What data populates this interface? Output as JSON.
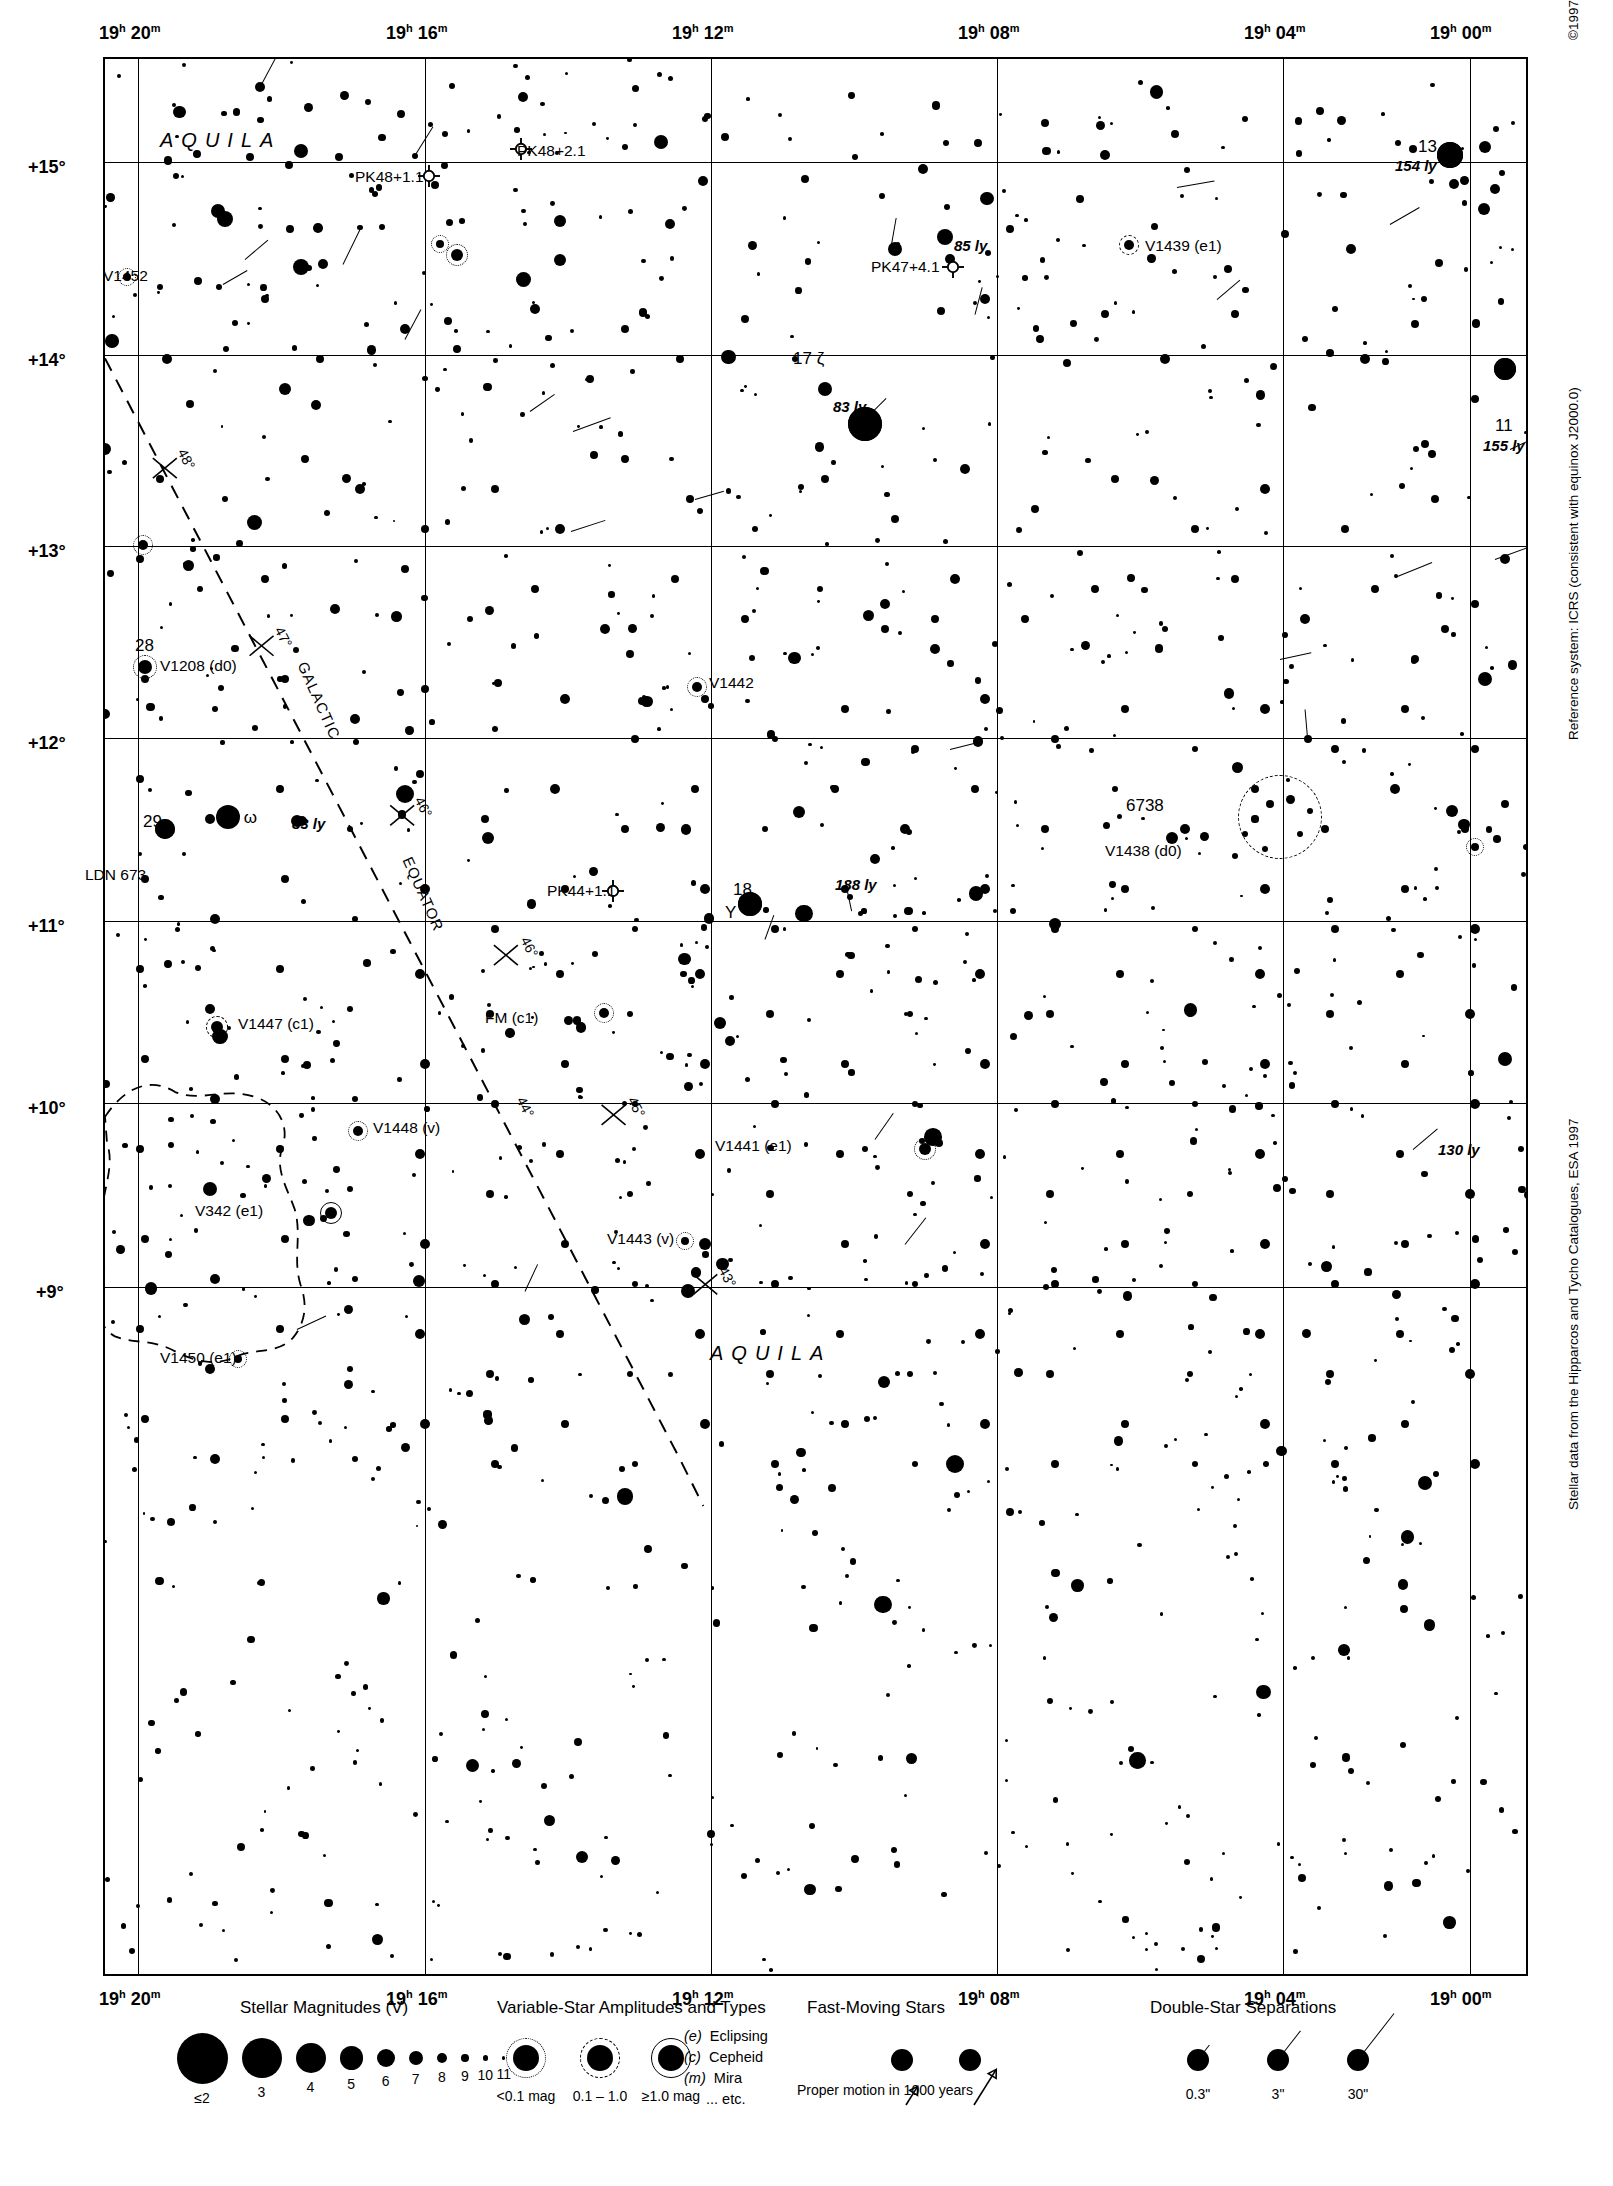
{
  "page": {
    "number": "1245",
    "next_page": "1269",
    "copyright": "©1997 Sky Publishing Corporation",
    "reference_note": "Reference system: ICRS (consistent with equinox J2000.0)",
    "data_note": "Stellar data from the Hipparcos and Tycho Catalogues, ESA 1997"
  },
  "axes": {
    "ra_ticks_top": [
      "19h 20m",
      "19h 16m",
      "19h 12m",
      "19h 08m",
      "19h 04m",
      "19h 00m"
    ],
    "ra_ticks_bottom": [
      "19h 20m",
      "19h 16m",
      "19h 12m",
      "19h 08m",
      "19h 04m",
      "19h 00m"
    ],
    "ra_hours": [
      "19",
      "19",
      "19",
      "19",
      "19",
      "19"
    ],
    "ra_minutes": [
      "20",
      "16",
      "12",
      "08",
      "04",
      "00"
    ],
    "dec_ticks": [
      "+15°",
      "+14°",
      "+13°",
      "+12°",
      "+11°",
      "+10°",
      "+9°"
    ],
    "ra_range": [
      "19h 22m",
      "18h 58m"
    ],
    "dec_range": [
      "+8.4°",
      "+15.8°"
    ]
  },
  "constellation_labels": [
    {
      "name": "AQUILA",
      "x": 155,
      "y": 118
    },
    {
      "name": "AQUILA",
      "x": 705,
      "y": 1345
    }
  ],
  "galactic_equator": {
    "label_word": "GALACTIC",
    "label_word2": "EQUATOR",
    "tick_labels": [
      "48°",
      "47°",
      "46°",
      "45°",
      "44°",
      "43°"
    ]
  },
  "objects": [
    {
      "id": "V1452",
      "label": "V1452",
      "type": "variable",
      "amp": "dot"
    },
    {
      "id": "PK48+1.1",
      "label": "PK48+1.1",
      "type": "planetary-nebula"
    },
    {
      "id": "PK48+2.1",
      "label": "PK48+2.1",
      "type": "planetary-nebula"
    },
    {
      "id": "PK47+4.1",
      "label": "PK47+4.1",
      "type": "planetary-nebula"
    },
    {
      "id": "PK44+1.1",
      "label": "PK44+1.1",
      "type": "planetary-nebula"
    },
    {
      "id": "13eps",
      "label": "13 ε",
      "distance": "154 ly",
      "type": "named-star"
    },
    {
      "id": "17zeta",
      "label": "17 ζ",
      "distance": "83 ly",
      "type": "named-star"
    },
    {
      "id": "11",
      "label": "11",
      "distance": "155 ly",
      "type": "named-star"
    },
    {
      "id": "hip85ly",
      "label": "",
      "distance": "85 ly",
      "type": "nearby-star"
    },
    {
      "id": "hip188ly",
      "label": "",
      "distance": "188 ly",
      "type": "nearby-star"
    },
    {
      "id": "hip130ly",
      "label": "",
      "distance": "130 ly",
      "type": "nearby-star"
    },
    {
      "id": "hip83ly",
      "label": "",
      "distance": "83 ly",
      "type": "nearby-star"
    },
    {
      "id": "V1439",
      "label": "V1439 (e1)",
      "type": "variable",
      "amp": "dash"
    },
    {
      "id": "V1438",
      "label": "V1438 (d0)",
      "type": "variable",
      "amp": "dot"
    },
    {
      "id": "V1442",
      "label": "V1442",
      "type": "variable",
      "amp": "dot"
    },
    {
      "id": "V1441",
      "label": "V1441 (e1)",
      "type": "variable",
      "amp": "dot"
    },
    {
      "id": "V1443",
      "label": "V1443 (v)",
      "type": "variable",
      "amp": "dot"
    },
    {
      "id": "V1447",
      "label": "V1447 (c1)",
      "type": "variable",
      "amp": "dash"
    },
    {
      "id": "V1448",
      "label": "V1448 (v)",
      "type": "variable",
      "amp": "dot"
    },
    {
      "id": "V1450",
      "label": "V1450 (e1)",
      "type": "variable",
      "amp": "dot"
    },
    {
      "id": "V1208",
      "label": "V1208 (d0)",
      "type": "variable",
      "amp": "dot"
    },
    {
      "id": "V342",
      "label": "V342 (e1)",
      "type": "variable",
      "amp": "sol"
    },
    {
      "id": "FM",
      "label": "FM (c1)",
      "type": "variable",
      "amp": "dot"
    },
    {
      "id": "Y",
      "label": "Y",
      "type": "variable"
    },
    {
      "id": "18",
      "label": "18",
      "type": "flamsteed"
    },
    {
      "id": "28",
      "label": "28",
      "type": "flamsteed"
    },
    {
      "id": "29",
      "label": "29",
      "type": "flamsteed"
    },
    {
      "id": "25omega",
      "label": "25 ω",
      "type": "flamsteed"
    },
    {
      "id": "6738",
      "label": "6738",
      "type": "open-cluster"
    },
    {
      "id": "LDN673",
      "label": "LDN 673",
      "type": "dark-nebula"
    }
  ],
  "legend": {
    "magnitudes": {
      "title": "Stellar Magnitudes (V)",
      "labels": [
        "≤2",
        "3",
        "4",
        "5",
        "6",
        "7",
        "8",
        "9",
        "10",
        "11"
      ],
      "radii": [
        25.5,
        20.0,
        15.0,
        11.6,
        9.0,
        7.0,
        5.2,
        3.8,
        2.6,
        1.8
      ]
    },
    "variables": {
      "title": "Variable-Star Amplitudes and Types",
      "amp_labels": [
        "<0.1 mag",
        "0.1 – 1.0",
        "≥1.0 mag"
      ],
      "types": [
        {
          "code": "(e)",
          "name": "Eclipsing"
        },
        {
          "code": "(c)",
          "name": "Cepheid"
        },
        {
          "code": "(m)",
          "name": "Mira"
        },
        {
          "code": "",
          "name": "... etc."
        }
      ]
    },
    "fast_moving": {
      "title": "Fast-Moving Stars",
      "caption": "Proper motion in 1000 years"
    },
    "double_stars": {
      "title": "Double-Star Separations",
      "labels": [
        "0.3\"",
        "3\"",
        "30\""
      ]
    }
  },
  "chart_data": {
    "type": "scatter",
    "xlabel": "Right Ascension",
    "ylabel": "Declination",
    "xlim": [
      "19h 22m",
      "18h 58m"
    ],
    "ylim": [
      8.4,
      15.8
    ],
    "grid": true,
    "legend_position": "bottom",
    "marker_scale": "stellar magnitude V: ≤2 (largest) to 11 (smallest)",
    "annotations": [
      {
        "text": "13 ε",
        "ra": "18h 59.6m",
        "dec": 15.07,
        "note": "154 ly"
      },
      {
        "text": "17 ζ",
        "ra": "19h 05.4m",
        "dec": 13.86,
        "note": "83 ly"
      },
      {
        "text": "11",
        "ra": "18h 58.5m",
        "dec": 13.6,
        "note": "155 ly"
      },
      {
        "text": "18",
        "ra": "19h 07.6m",
        "dec": 11.1,
        "note": ""
      },
      {
        "text": "25 ω",
        "ra": "19h 17.5m",
        "dec": 11.56,
        "note": ""
      },
      {
        "text": "28",
        "ra": "19h 19.8m",
        "dec": 12.38,
        "note": ""
      },
      {
        "text": "29",
        "ra": "19h 19.6m",
        "dec": 11.55,
        "note": ""
      },
      {
        "text": "6738",
        "ra": "19h 01.4m",
        "dec": 11.63,
        "note": "open cluster"
      },
      {
        "text": "LDN 673",
        "ra": "19h 21.0m",
        "dec": 11.33,
        "note": "dark nebula"
      },
      {
        "text": "PK48+1.1",
        "ra": "19h 13.6m",
        "dec": 15.0,
        "note": "planetary nebula"
      },
      {
        "text": "PK48+2.1",
        "ra": "19h 11.2m",
        "dec": 15.37,
        "note": "planetary nebula"
      },
      {
        "text": "PK47+4.1",
        "ra": "19h 03.1m",
        "dec": 14.08,
        "note": "planetary nebula"
      },
      {
        "text": "PK44+1.1",
        "ra": "19h 10.4m",
        "dec": 11.15,
        "note": "planetary nebula"
      }
    ]
  }
}
